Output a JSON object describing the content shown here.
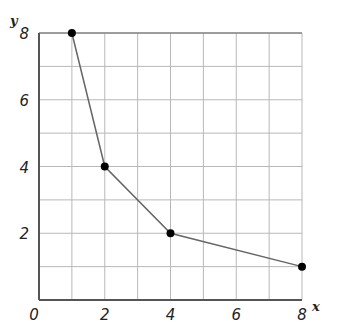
{
  "chart_data": {
    "type": "line",
    "title": "",
    "xlabel": "x",
    "ylabel": "y",
    "xlim": [
      0,
      8
    ],
    "ylim": [
      0,
      8
    ],
    "grid": true,
    "grid_step": 1,
    "x_ticks": [
      "0",
      "2",
      "4",
      "6",
      "8"
    ],
    "y_ticks": [
      "2",
      "4",
      "6",
      "8"
    ],
    "series": [
      {
        "name": "y = 8/x",
        "x": [
          1,
          2,
          4,
          8
        ],
        "y": [
          8,
          4,
          2,
          1
        ],
        "markers": true
      }
    ]
  },
  "colors": {
    "grid": "#b8b8b8",
    "axis": "#555555",
    "line": "#666666",
    "marker": "#000000"
  }
}
